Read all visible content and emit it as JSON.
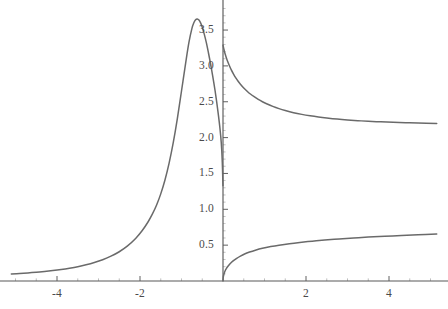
{
  "figure": {
    "background_color": "#ffffff",
    "curve_color": "#6a6a6a",
    "axis_color": "#595959",
    "tick_label_color": "#4a4a4a"
  },
  "chart_data": {
    "type": "line",
    "title": "",
    "subtitle": "",
    "xlabel": "",
    "ylabel": "",
    "xlim": [
      -5.1,
      5.15
    ],
    "ylim": [
      0,
      3.83
    ],
    "grid": false,
    "legend": null,
    "axes": {
      "x_axis_position_y": 0,
      "y_axis_position_x": 0,
      "x_ticks": [
        -4,
        -2,
        2,
        4
      ],
      "x_tick_labels": [
        "-4",
        "-2",
        "2",
        "4"
      ],
      "x_minor_tick_step": 0.5,
      "y_ticks": [
        0.5,
        1.0,
        1.5,
        2.0,
        2.5,
        3.0,
        3.5
      ],
      "y_tick_labels": [
        "0.5",
        "1.0",
        "1.5",
        "2.0",
        "2.5",
        "3.0",
        "3.5"
      ],
      "y_minor_tick_step": 0.1
    },
    "annotations": [
      {
        "text": "peak",
        "x": -1.0,
        "y": 3.65
      },
      {
        "text": "left limit at x=0",
        "x": 0,
        "y": 1.33
      },
      {
        "text": "right limit at x=0",
        "x": 0,
        "y": 3.29
      },
      {
        "text": "right asymptote",
        "x": 5.1,
        "y": 2.15
      }
    ],
    "series": [
      {
        "name": "branch-left",
        "color": "#6a6a6a",
        "points": [
          [
            -5.1,
            0.098
          ],
          [
            -4.9,
            0.105
          ],
          [
            -4.7,
            0.113
          ],
          [
            -4.5,
            0.122
          ],
          [
            -4.3,
            0.133
          ],
          [
            -4.1,
            0.146
          ],
          [
            -3.9,
            0.161
          ],
          [
            -3.7,
            0.179
          ],
          [
            -3.5,
            0.2
          ],
          [
            -3.3,
            0.226
          ],
          [
            -3.1,
            0.258
          ],
          [
            -2.9,
            0.297
          ],
          [
            -2.7,
            0.346
          ],
          [
            -2.5,
            0.408
          ],
          [
            -2.3,
            0.489
          ],
          [
            -2.1,
            0.597
          ],
          [
            -1.95,
            0.7
          ],
          [
            -1.8,
            0.83
          ],
          [
            -1.7,
            0.935
          ],
          [
            -1.6,
            1.06
          ],
          [
            -1.5,
            1.215
          ],
          [
            -1.4,
            1.405
          ],
          [
            -1.3,
            1.64
          ],
          [
            -1.2,
            1.925
          ],
          [
            -1.1,
            2.265
          ],
          [
            -1.0,
            2.65
          ],
          [
            -0.9,
            3.04
          ],
          [
            -0.82,
            3.33
          ],
          [
            -0.75,
            3.52
          ],
          [
            -0.7,
            3.605
          ],
          [
            -0.66,
            3.645
          ],
          [
            -0.62,
            3.655
          ],
          [
            -0.58,
            3.64
          ],
          [
            -0.54,
            3.6
          ],
          [
            -0.5,
            3.54
          ],
          [
            -0.45,
            3.44
          ],
          [
            -0.4,
            3.32
          ],
          [
            -0.35,
            3.18
          ],
          [
            -0.3,
            3.03
          ],
          [
            -0.25,
            2.865
          ],
          [
            -0.22,
            2.76
          ],
          [
            -0.19,
            2.65
          ],
          [
            -0.16,
            2.53
          ],
          [
            -0.13,
            2.4
          ],
          [
            -0.11,
            2.31
          ],
          [
            -0.09,
            2.215
          ],
          [
            -0.07,
            2.11
          ],
          [
            -0.055,
            2.02
          ],
          [
            -0.042,
            1.93
          ],
          [
            -0.032,
            1.84
          ],
          [
            -0.024,
            1.75
          ],
          [
            -0.017,
            1.655
          ],
          [
            -0.012,
            1.57
          ],
          [
            -0.008,
            1.49
          ],
          [
            -0.005,
            1.42
          ],
          [
            -0.003,
            1.375
          ],
          [
            -0.0015,
            1.35
          ],
          [
            -0.0005,
            1.335
          ],
          [
            0.0,
            1.33
          ]
        ]
      },
      {
        "name": "branch-right-upper",
        "color": "#6a6a6a",
        "points": [
          [
            0.0,
            3.29
          ],
          [
            0.02,
            3.235
          ],
          [
            0.05,
            3.17
          ],
          [
            0.08,
            3.115
          ],
          [
            0.12,
            3.05
          ],
          [
            0.16,
            2.995
          ],
          [
            0.2,
            2.945
          ],
          [
            0.25,
            2.89
          ],
          [
            0.3,
            2.84
          ],
          [
            0.36,
            2.79
          ],
          [
            0.42,
            2.745
          ],
          [
            0.5,
            2.692
          ],
          [
            0.58,
            2.648
          ],
          [
            0.66,
            2.608
          ],
          [
            0.75,
            2.57
          ],
          [
            0.85,
            2.532
          ],
          [
            0.95,
            2.5
          ],
          [
            1.05,
            2.472
          ],
          [
            1.2,
            2.435
          ],
          [
            1.35,
            2.404
          ],
          [
            1.5,
            2.378
          ],
          [
            1.7,
            2.348
          ],
          [
            1.9,
            2.324
          ],
          [
            2.1,
            2.304
          ],
          [
            2.3,
            2.287
          ],
          [
            2.5,
            2.273
          ],
          [
            2.75,
            2.258
          ],
          [
            3.0,
            2.246
          ],
          [
            3.25,
            2.236
          ],
          [
            3.5,
            2.228
          ],
          [
            3.8,
            2.22
          ],
          [
            4.1,
            2.213
          ],
          [
            4.4,
            2.208
          ],
          [
            4.7,
            2.204
          ],
          [
            5.15,
            2.198
          ]
        ]
      },
      {
        "name": "branch-right-lower",
        "color": "#6a6a6a",
        "points": [
          [
            0.0,
            0.0
          ],
          [
            0.005,
            0.045
          ],
          [
            0.012,
            0.07
          ],
          [
            0.02,
            0.09
          ],
          [
            0.035,
            0.118
          ],
          [
            0.055,
            0.146
          ],
          [
            0.08,
            0.172
          ],
          [
            0.11,
            0.199
          ],
          [
            0.15,
            0.228
          ],
          [
            0.2,
            0.258
          ],
          [
            0.26,
            0.288
          ],
          [
            0.33,
            0.317
          ],
          [
            0.42,
            0.348
          ],
          [
            0.52,
            0.377
          ],
          [
            0.64,
            0.404
          ],
          [
            0.78,
            0.43
          ],
          [
            0.95,
            0.456
          ],
          [
            1.15,
            0.48
          ],
          [
            1.35,
            0.5
          ],
          [
            1.6,
            0.521
          ],
          [
            1.85,
            0.538
          ],
          [
            2.15,
            0.556
          ],
          [
            2.45,
            0.571
          ],
          [
            2.8,
            0.587
          ],
          [
            3.15,
            0.6
          ],
          [
            3.5,
            0.612
          ],
          [
            3.9,
            0.624
          ],
          [
            4.3,
            0.635
          ],
          [
            4.7,
            0.645
          ],
          [
            5.15,
            0.655
          ]
        ]
      }
    ]
  }
}
